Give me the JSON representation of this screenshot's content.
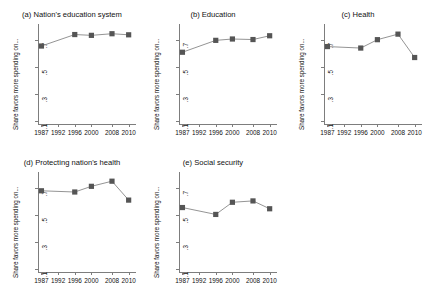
{
  "figure": {
    "ylabel": "Share favors more spending on...",
    "y_ticks": [
      ".1",
      ".3",
      ".5",
      ".7"
    ],
    "y_tick_values": [
      0.1,
      0.3,
      0.5,
      0.7
    ],
    "x_ticks": [
      "1987",
      "1992",
      "1996",
      "2000",
      "2008",
      "2010"
    ],
    "marker_color": "#555555",
    "line_color": "#888888",
    "axis_color": "#7d7d7d"
  },
  "chart_data": [
    {
      "type": "line",
      "title": "(a) Nation's education system",
      "xlabel": "",
      "ylabel": "Share favors more spending on...",
      "ylim": [
        0.08,
        0.82
      ],
      "grid": false,
      "legend": "none",
      "categories": [
        "1987",
        "1992",
        "1996",
        "2000",
        "2008",
        "2010"
      ],
      "x": [
        1987,
        1996,
        2000,
        2008,
        2010
      ],
      "values": [
        0.657,
        0.742,
        0.736,
        0.748,
        0.74
      ]
    },
    {
      "type": "line",
      "title": "(b) Education",
      "xlabel": "",
      "ylabel": "Share favors more spending on...",
      "ylim": [
        0.08,
        0.82
      ],
      "grid": false,
      "legend": "none",
      "categories": [
        "1987",
        "1992",
        "1996",
        "2000",
        "2008",
        "2010"
      ],
      "x": [
        1987,
        1996,
        2000,
        2008,
        2010
      ],
      "values": [
        0.611,
        0.699,
        0.709,
        0.705,
        0.733
      ]
    },
    {
      "type": "line",
      "title": "(c) Health",
      "xlabel": "",
      "ylabel": "Share favors more spending on...",
      "ylim": [
        0.08,
        0.82
      ],
      "grid": false,
      "legend": "none",
      "categories": [
        "1987",
        "1992",
        "1996",
        "2000",
        "2008",
        "2010"
      ],
      "x": [
        1987,
        1996,
        2000,
        2008,
        2010
      ],
      "values": [
        0.653,
        0.642,
        0.704,
        0.745,
        0.572
      ]
    },
    {
      "type": "line",
      "title": "(d) Protecting nation's health",
      "xlabel": "",
      "ylabel": "Share favors more spending on...",
      "ylim": [
        0.08,
        0.82
      ],
      "grid": false,
      "legend": "none",
      "categories": [
        "1987",
        "1992",
        "1996",
        "2000",
        "2008",
        "2010"
      ],
      "x": [
        1987,
        1996,
        2000,
        2008,
        2010
      ],
      "values": [
        0.681,
        0.672,
        0.714,
        0.752,
        0.612
      ]
    },
    {
      "type": "line",
      "title": "(e) Social security",
      "xlabel": "",
      "ylabel": "Share favors more spending on...",
      "ylim": [
        0.08,
        0.82
      ],
      "grid": false,
      "legend": "none",
      "categories": [
        "1987",
        "1992",
        "1996",
        "2000",
        "2008",
        "2010"
      ],
      "x": [
        1987,
        1996,
        2000,
        2008,
        2010
      ],
      "values": [
        0.557,
        0.506,
        0.596,
        0.606,
        0.548
      ]
    }
  ]
}
